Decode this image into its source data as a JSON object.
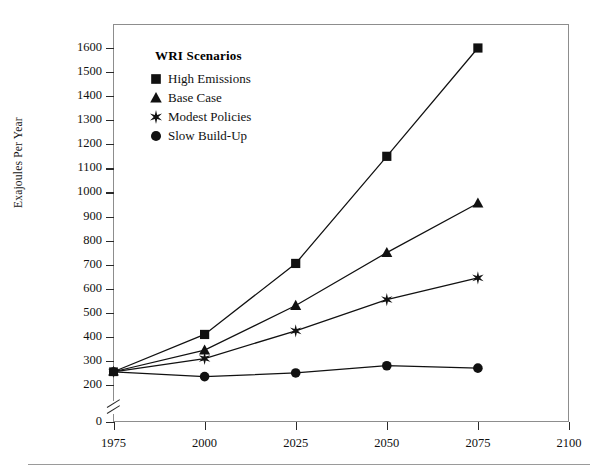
{
  "chart_data": {
    "type": "line",
    "title": "",
    "xlabel": "",
    "ylabel": "Exajoules Per Year",
    "legend_title": "WRI Scenarios",
    "legend_position": "top-left-inside",
    "grid": false,
    "x": [
      1975,
      2000,
      2025,
      2050,
      2075
    ],
    "xlim": [
      1975,
      2100
    ],
    "xticks": [
      "1975",
      "2000",
      "2025",
      "2050",
      "2075",
      "2100"
    ],
    "ylim": [
      0,
      1650
    ],
    "y_axis_break": true,
    "yticks": [
      "0",
      "200",
      "300",
      "400",
      "500",
      "600",
      "700",
      "800",
      "900",
      "1000",
      "1100",
      "1200",
      "1300",
      "1400",
      "1500",
      "1600"
    ],
    "series": [
      {
        "name": "High Emissions",
        "marker": "square",
        "color": "#111111",
        "values": [
          255,
          410,
          705,
          1150,
          1600
        ]
      },
      {
        "name": "Base Case",
        "marker": "triangle",
        "color": "#111111",
        "values": [
          255,
          345,
          530,
          750,
          955
        ]
      },
      {
        "name": "Modest Policies",
        "marker": "star",
        "color": "#111111",
        "values": [
          255,
          310,
          425,
          555,
          645
        ]
      },
      {
        "name": "Slow Build-Up",
        "marker": "circle",
        "color": "#111111",
        "values": [
          255,
          235,
          250,
          280,
          270
        ]
      }
    ]
  },
  "axis": {
    "ylabel": "Exajoules Per Year",
    "yticks": [
      {
        "label": "1600",
        "value": 1600
      },
      {
        "label": "1500",
        "value": 1500
      },
      {
        "label": "1400",
        "value": 1400
      },
      {
        "label": "1300",
        "value": 1300
      },
      {
        "label": "1200",
        "value": 1200
      },
      {
        "label": "1100",
        "value": 1100
      },
      {
        "label": "1000",
        "value": 1000
      },
      {
        "label": "900",
        "value": 900
      },
      {
        "label": "800",
        "value": 800
      },
      {
        "label": "700",
        "value": 700
      },
      {
        "label": "600",
        "value": 600
      },
      {
        "label": "500",
        "value": 500
      },
      {
        "label": "400",
        "value": 400
      },
      {
        "label": "300",
        "value": 300
      },
      {
        "label": "200",
        "value": 200
      },
      {
        "label": "0",
        "value": 0
      }
    ],
    "xticks": [
      {
        "label": "1975",
        "value": 1975
      },
      {
        "label": "2000",
        "value": 2000
      },
      {
        "label": "2025",
        "value": 2025
      },
      {
        "label": "2050",
        "value": 2050
      },
      {
        "label": "2075",
        "value": 2075
      },
      {
        "label": "2100",
        "value": 2100
      }
    ]
  },
  "legend": {
    "title": "WRI Scenarios",
    "items": [
      {
        "label": "High Emissions",
        "marker": "square"
      },
      {
        "label": "Base Case",
        "marker": "triangle"
      },
      {
        "label": "Modest Policies",
        "marker": "star"
      },
      {
        "label": "Slow Build-Up",
        "marker": "circle"
      }
    ]
  },
  "colors": {
    "ink": "#111111",
    "frame": "#8d8d8d",
    "rule": "#9a9a9a"
  }
}
